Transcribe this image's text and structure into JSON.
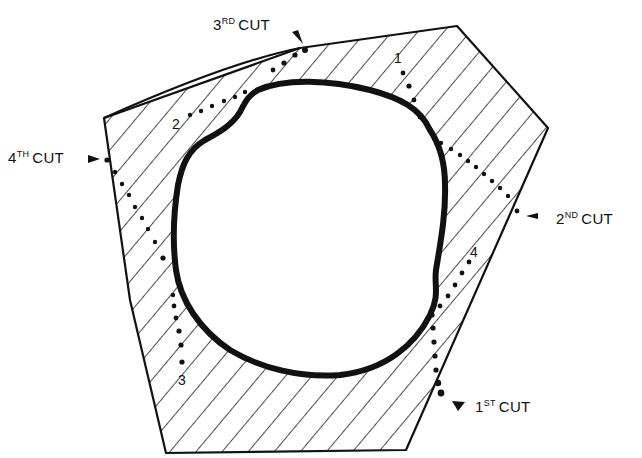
{
  "diagram": {
    "cut_labels": [
      {
        "id": "cut1",
        "number": "1",
        "suffix": "ST",
        "word": "CUT"
      },
      {
        "id": "cut2",
        "number": "2",
        "suffix": "ND",
        "word": "CUT"
      },
      {
        "id": "cut3",
        "number": "3",
        "suffix": "RD",
        "word": "CUT"
      },
      {
        "id": "cut4",
        "number": "4",
        "suffix": "TH",
        "word": "CUT"
      }
    ],
    "cut_numbers": [
      "1",
      "2",
      "3",
      "4"
    ],
    "colors": {
      "ink": "#111111",
      "background": "#ffffff"
    }
  }
}
